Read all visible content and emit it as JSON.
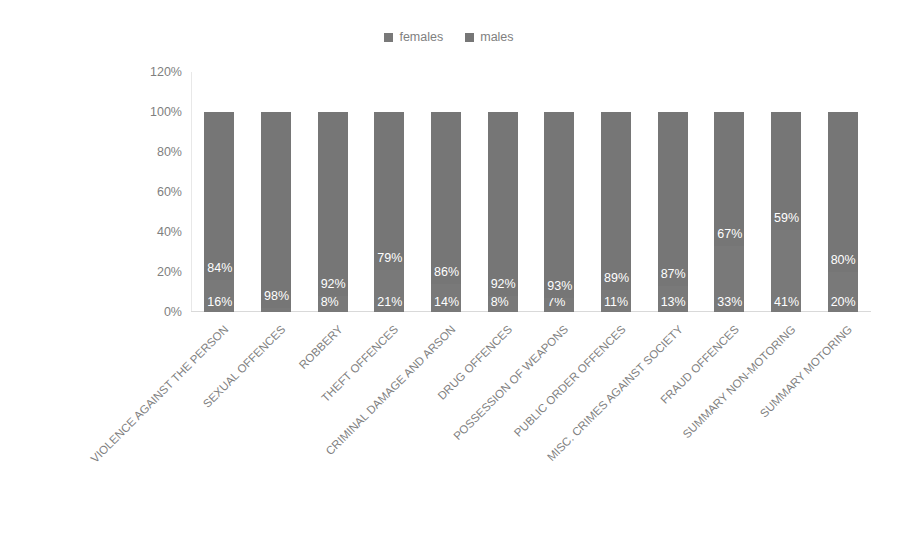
{
  "legend": {
    "position": "top-center",
    "entries": [
      {
        "label": "females",
        "color": "#797979",
        "marker": "square-marker"
      },
      {
        "label": "males",
        "color": "#767676",
        "marker": "square-marker"
      }
    ]
  },
  "axis": {
    "y_ticks": [
      "0%",
      "20%",
      "40%",
      "60%",
      "80%",
      "100%",
      "120%"
    ],
    "y_tick_values": [
      0,
      20,
      40,
      60,
      80,
      100,
      120
    ]
  },
  "chart_data": {
    "type": "bar",
    "subtype": "stacked-100-percent",
    "title": "",
    "subtitle": "",
    "xlabel": "",
    "ylabel": "",
    "ylim": [
      0,
      120
    ],
    "yticks": [
      0,
      20,
      40,
      60,
      80,
      100,
      120
    ],
    "ytick_labels": [
      "0%",
      "20%",
      "40%",
      "60%",
      "80%",
      "100%",
      "120%"
    ],
    "grid": false,
    "legend_position": "top-center",
    "value_suffix": "%",
    "categories": [
      "VIOLENCE AGAINST THE PERSON",
      "SEXUAL OFFENCES",
      "ROBBERY",
      "THEFT OFFENCES",
      "CRIMINAL DAMAGE AND ARSON",
      "DRUG OFFENCES",
      "POSSESSION OF WEAPONS",
      "PUBLIC ORDER OFFENCES",
      "MISC. CRIMES AGAINST SOCIETY",
      "FRAUD OFFENCES",
      "SUMMARY NON-MOTORING",
      "SUMMARY MOTORING"
    ],
    "series": [
      {
        "name": "females",
        "color": "#797979",
        "values": [
          16,
          2,
          8,
          21,
          14,
          8,
          7,
          11,
          13,
          33,
          41,
          20
        ],
        "labels": [
          "16%",
          "2%",
          "8%",
          "21%",
          "14%",
          "8%",
          "7%",
          "11%",
          "13%",
          "33%",
          "41%",
          "20%"
        ]
      },
      {
        "name": "males",
        "color": "#767676",
        "values": [
          84,
          98,
          92,
          79,
          86,
          92,
          93,
          89,
          87,
          67,
          59,
          80
        ],
        "labels": [
          "84%",
          "98%",
          "92%",
          "79%",
          "86%",
          "92%",
          "93%",
          "89%",
          "87%",
          "67%",
          "59%",
          "80%"
        ]
      }
    ]
  }
}
